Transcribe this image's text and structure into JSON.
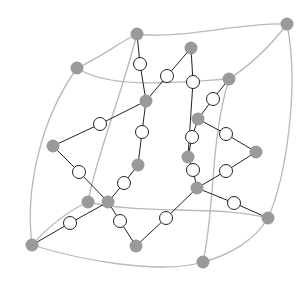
{
  "diagram": {
    "width": 308,
    "height": 285,
    "colors": {
      "background": "#ffffff",
      "curve": "#b8b8b8",
      "edge": "#222222",
      "gray_node": "#9a9a9a",
      "white_node_fill": "#ffffff",
      "white_node_stroke": "#222222"
    },
    "gray_nodes": [
      {
        "id": "g1",
        "x": 137,
        "y": 34
      },
      {
        "id": "g2",
        "x": 77,
        "y": 68
      },
      {
        "id": "g3",
        "x": 191,
        "y": 48
      },
      {
        "id": "g4",
        "x": 229,
        "y": 79
      },
      {
        "id": "g5",
        "x": 146,
        "y": 101
      },
      {
        "id": "g6",
        "x": 198,
        "y": 119
      },
      {
        "id": "g7",
        "x": 53,
        "y": 146
      },
      {
        "id": "g8",
        "x": 138,
        "y": 165
      },
      {
        "id": "g9",
        "x": 188,
        "y": 157
      },
      {
        "id": "g10",
        "x": 256,
        "y": 152
      },
      {
        "id": "g11",
        "x": 197,
        "y": 188
      },
      {
        "id": "g12",
        "x": 108,
        "y": 202
      },
      {
        "id": "g13",
        "x": 88,
        "y": 202
      },
      {
        "id": "g14",
        "x": 32,
        "y": 245
      },
      {
        "id": "g15",
        "x": 136,
        "y": 246
      },
      {
        "id": "g16",
        "x": 268,
        "y": 218
      },
      {
        "id": "g17",
        "x": 203,
        "y": 262
      },
      {
        "id": "g18",
        "x": 287,
        "y": 24
      }
    ],
    "white_nodes": [
      {
        "id": "w1",
        "x": 140,
        "y": 64
      },
      {
        "id": "w2",
        "x": 167,
        "y": 76
      },
      {
        "id": "w3",
        "x": 193,
        "y": 82
      },
      {
        "id": "w4",
        "x": 213,
        "y": 99
      },
      {
        "id": "w5",
        "x": 100,
        "y": 124
      },
      {
        "id": "w6",
        "x": 142,
        "y": 132
      },
      {
        "id": "w7",
        "x": 192,
        "y": 137
      },
      {
        "id": "w8",
        "x": 226,
        "y": 134
      },
      {
        "id": "w9",
        "x": 193,
        "y": 170
      },
      {
        "id": "w10",
        "x": 226,
        "y": 171
      },
      {
        "id": "w11",
        "x": 79,
        "y": 172
      },
      {
        "id": "w12",
        "x": 124,
        "y": 183
      },
      {
        "id": "w13",
        "x": 70,
        "y": 223
      },
      {
        "id": "w14",
        "x": 120,
        "y": 221
      },
      {
        "id": "w15",
        "x": 166,
        "y": 218
      },
      {
        "id": "w16",
        "x": 234,
        "y": 203
      }
    ],
    "edges": [
      [
        "g1",
        "w1"
      ],
      [
        "w1",
        "g5"
      ],
      [
        "g3",
        "w2"
      ],
      [
        "w2",
        "g5"
      ],
      [
        "g3",
        "w3"
      ],
      [
        "w3",
        "g9"
      ],
      [
        "g4",
        "w4"
      ],
      [
        "w4",
        "g6"
      ],
      [
        "g5",
        "w5"
      ],
      [
        "w5",
        "g7"
      ],
      [
        "g5",
        "w6"
      ],
      [
        "w6",
        "g8"
      ],
      [
        "g6",
        "w7"
      ],
      [
        "w7",
        "g9"
      ],
      [
        "g6",
        "w8"
      ],
      [
        "w8",
        "g10"
      ],
      [
        "g10",
        "w10"
      ],
      [
        "w10",
        "g11"
      ],
      [
        "g9",
        "w9"
      ],
      [
        "w9",
        "g11"
      ],
      [
        "g7",
        "w11"
      ],
      [
        "w11",
        "g12"
      ],
      [
        "g8",
        "w12"
      ],
      [
        "w12",
        "g12"
      ],
      [
        "g12",
        "w13"
      ],
      [
        "w13",
        "g14"
      ],
      [
        "g12",
        "w14"
      ],
      [
        "w14",
        "g15"
      ],
      [
        "g11",
        "w15"
      ],
      [
        "w15",
        "g15"
      ],
      [
        "g11",
        "w16"
      ],
      [
        "w16",
        "g16"
      ]
    ],
    "curves": [
      "M137,34 C180,40 240,22 287,24",
      "M77,68 C100,58 120,42 137,34",
      "M77,68 C110,90 180,82 229,79",
      "M229,79 C255,62 275,40 287,24",
      "M77,68 C40,120 25,190 32,245",
      "M137,34 C120,100 95,160 88,202",
      "M287,24 C300,90 285,180 268,218",
      "M229,79 C210,140 215,210 203,262",
      "M32,245 C50,225 70,210 88,202",
      "M88,202 C140,215 220,205 268,218",
      "M32,245 C80,260 160,275 203,262",
      "M203,262 C230,255 255,240 268,218"
    ]
  }
}
